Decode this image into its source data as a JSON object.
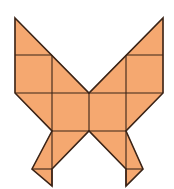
{
  "figure": {
    "title": "Tangram-style butterfly made of squares and triangles",
    "fill_color": "#F5A870",
    "stroke_color": "#3a2418",
    "background": "#ffffff"
  },
  "shapes": {
    "outline": "15,18 89,93 163,18 163,93 126,131 143,169 126,186 126,169 89,131 52,169 52,186 32,169 52,131 15,93",
    "pieces": [
      {
        "name": "left-upper-triangle",
        "points": "15,18 52,55 15,55"
      },
      {
        "name": "left-upper-square",
        "points": "15,55 52,55 52,93 15,93"
      },
      {
        "name": "left-upper-diag-triangle",
        "points": "52,55 89,93 52,93"
      },
      {
        "name": "right-upper-triangle",
        "points": "163,18 163,55 126,55"
      },
      {
        "name": "right-upper-square",
        "points": "126,55 163,55 163,93 126,93"
      },
      {
        "name": "right-upper-diag-triangle",
        "points": "126,55 126,93 89,93"
      },
      {
        "name": "center-left-square",
        "points": "52,93 89,93 89,131 52,131"
      },
      {
        "name": "center-right-square",
        "points": "89,93 126,93 126,131 89,131"
      },
      {
        "name": "left-outer-lower-triangle",
        "points": "15,93 52,93 52,131"
      },
      {
        "name": "right-outer-lower-triangle",
        "points": "163,93 126,93 126,131"
      },
      {
        "name": "left-lower-wing",
        "points": "52,131 89,131 52,169"
      },
      {
        "name": "left-lower-wing-outer",
        "points": "52,131 52,169 32,169"
      },
      {
        "name": "left-tail-triangle",
        "points": "32,169 52,169 52,186"
      },
      {
        "name": "right-lower-wing",
        "points": "89,131 126,131 126,169"
      },
      {
        "name": "right-lower-wing-outer",
        "points": "126,131 143,169 126,169"
      },
      {
        "name": "right-tail-triangle",
        "points": "126,169 143,169 126,186"
      }
    ],
    "lines": [
      {
        "name": "left-top-horizontal",
        "x1": 15,
        "y1": 55,
        "x2": 52,
        "y2": 55
      },
      {
        "name": "right-top-horizontal",
        "x1": 126,
        "y1": 55,
        "x2": 163,
        "y2": 55
      },
      {
        "name": "middle-horizontal",
        "x1": 15,
        "y1": 93,
        "x2": 163,
        "y2": 93
      },
      {
        "name": "lower-horizontal",
        "x1": 52,
        "y1": 131,
        "x2": 126,
        "y2": 131
      },
      {
        "name": "left-vertical",
        "x1": 52,
        "y1": 55,
        "x2": 52,
        "y2": 186
      },
      {
        "name": "right-vertical",
        "x1": 126,
        "y1": 55,
        "x2": 126,
        "y2": 186
      },
      {
        "name": "center-vertical",
        "x1": 89,
        "y1": 93,
        "x2": 89,
        "y2": 131
      },
      {
        "name": "left-tail-horizontal",
        "x1": 32,
        "y1": 169,
        "x2": 52,
        "y2": 169
      },
      {
        "name": "right-tail-horizontal",
        "x1": 126,
        "y1": 169,
        "x2": 143,
        "y2": 169
      }
    ]
  }
}
